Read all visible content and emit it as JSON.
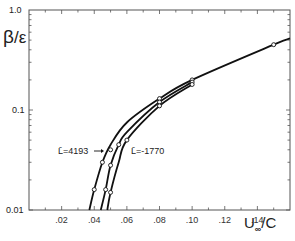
{
  "chart_data": {
    "type": "line",
    "title": "",
    "xlabel": "U∞/C",
    "ylabel": "β/ε",
    "xscale": "linear",
    "yscale": "log",
    "xlim": [
      0,
      0.16
    ],
    "ylim": [
      0.01,
      1.0
    ],
    "x_ticks": [
      ".02",
      ".04",
      ".06",
      ".08",
      ".10",
      ".12",
      ".14"
    ],
    "y_ticks": [
      "0.01",
      "0.1",
      "1.0"
    ],
    "grid": false,
    "series": [
      {
        "name": "L̄=4193",
        "x": [
          0.037,
          0.04,
          0.045,
          0.05,
          0.06,
          0.08,
          0.1,
          0.15,
          0.16
        ],
        "y": [
          0.01,
          0.016,
          0.03,
          0.045,
          0.075,
          0.13,
          0.2,
          0.45,
          0.52
        ],
        "markers_x": [
          0.04,
          0.045,
          0.05,
          0.08,
          0.1,
          0.15
        ],
        "markers_y": [
          0.016,
          0.03,
          0.04,
          0.13,
          0.2,
          0.45
        ]
      },
      {
        "name": "middle",
        "x": [
          0.044,
          0.047,
          0.05,
          0.055,
          0.06,
          0.08,
          0.1
        ],
        "y": [
          0.01,
          0.016,
          0.028,
          0.045,
          0.06,
          0.12,
          0.19
        ],
        "markers_x": [
          0.047,
          0.05,
          0.055,
          0.08,
          0.1
        ],
        "markers_y": [
          0.016,
          0.028,
          0.045,
          0.12,
          0.19
        ]
      },
      {
        "name": "L̄=-1770",
        "x": [
          0.048,
          0.05,
          0.055,
          0.06,
          0.08,
          0.1
        ],
        "y": [
          0.01,
          0.015,
          0.03,
          0.05,
          0.11,
          0.18
        ],
        "markers_x": [
          0.05,
          0.06,
          0.08,
          0.1
        ],
        "markers_y": [
          0.015,
          0.05,
          0.11,
          0.18
        ]
      }
    ],
    "annotations": [
      {
        "text": "L̄=4193",
        "arrow_to_series": "L̄=4193"
      },
      {
        "text": "L̄=-1770",
        "series": "L̄=-1770"
      }
    ]
  },
  "labels": {
    "ylabel_main": "β",
    "ylabel_sub": "/ε",
    "xlabel_main": "U",
    "xlabel_sub": "∞",
    "xlabel_tail": "/C",
    "ann_left": "L̄=4193",
    "ann_right": "L̄=-1770",
    "y_top": "1.0",
    "y_mid": "0.1",
    "y_bot": "0.01"
  }
}
